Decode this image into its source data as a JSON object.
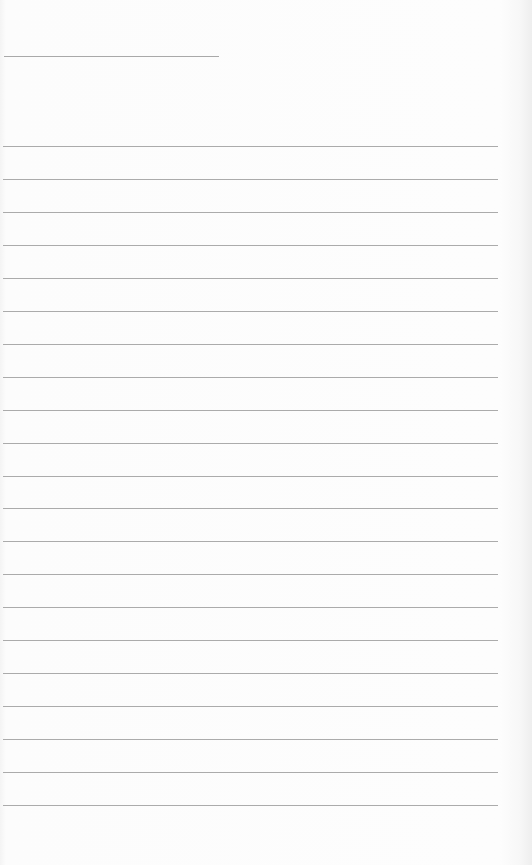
{
  "document": {
    "type": "lined-paper",
    "title": "",
    "colors": {
      "paper": "#fdfdfd",
      "rule": "#ababab",
      "edge_shadow": "#eeeeee"
    },
    "title_line": {
      "y": 56,
      "x_start": 4,
      "x_end": 219
    },
    "ruled_lines": {
      "count": 21,
      "first_y": 146,
      "spacing": 32.95,
      "x_start": 3,
      "x_end": 498,
      "entries": [
        "",
        "",
        "",
        "",
        "",
        "",
        "",
        "",
        "",
        "",
        "",
        "",
        "",
        "",
        "",
        "",
        "",
        "",
        "",
        "",
        ""
      ]
    }
  }
}
